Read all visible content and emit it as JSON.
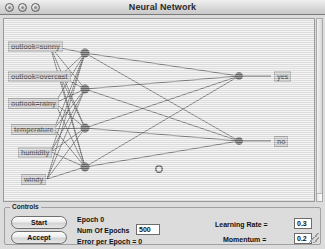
{
  "window": {
    "title": "Neural Network",
    "buttons": [
      "close-button",
      "minimize-button",
      "zoom-button"
    ]
  },
  "network": {
    "input_labels": [
      "outlook=sunny",
      "outlook=overcast",
      "outlook=rainy",
      "temperature",
      "humidity",
      "windy"
    ],
    "output_labels": [
      "yes",
      "no"
    ],
    "hidden_node_count": 4,
    "output_node_count": 2,
    "unconnected_node_count": 1
  },
  "controls": {
    "group_title": "Controls",
    "start_label": "Start",
    "accept_label": "Accept",
    "epoch_label": "Epoch  0",
    "num_epochs_label": "Num Of Epochs",
    "num_epochs_value": "500",
    "error_label": "Error per Epoch = 0",
    "learning_rate_label": "Learning Rate =",
    "learning_rate_value": "0.3",
    "momentum_label": "Momentum =",
    "momentum_value": "0.2"
  },
  "chart_data": {
    "type": "diagram",
    "title": "Neural Network",
    "layers": [
      {
        "name": "input",
        "nodes": [
          {
            "label": "outlook=sunny",
            "x": 46,
            "y": 27
          },
          {
            "label": "outlook=overcast",
            "x": 56,
            "y": 57
          },
          {
            "label": "outlook=rainy",
            "x": 51,
            "y": 84
          },
          {
            "label": "temperature",
            "x": 50,
            "y": 110
          },
          {
            "label": "humidity",
            "x": 47,
            "y": 133
          },
          {
            "label": "windy",
            "x": 43,
            "y": 160
          }
        ]
      },
      {
        "name": "hidden",
        "nodes": [
          {
            "label": "",
            "x": 81,
            "y": 34
          },
          {
            "label": "",
            "x": 81,
            "y": 70
          },
          {
            "label": "",
            "x": 81,
            "y": 109
          },
          {
            "label": "",
            "x": 81,
            "y": 148
          }
        ]
      },
      {
        "name": "output",
        "nodes": [
          {
            "label": "yes",
            "x": 235,
            "y": 57
          },
          {
            "label": "no",
            "x": 235,
            "y": 122
          }
        ]
      },
      {
        "name": "isolated",
        "nodes": [
          {
            "label": "",
            "x": 155,
            "y": 150
          }
        ]
      }
    ],
    "edges_input_to_hidden": 24,
    "edges_hidden_to_output": 8
  },
  "colors": {
    "canvas_background": "#e7e7e7",
    "node_fill": "#2e2e2e",
    "edge": "#1a1a1a",
    "label_background": "#bdbdbd",
    "window_chrome": "#dcdcdc"
  }
}
